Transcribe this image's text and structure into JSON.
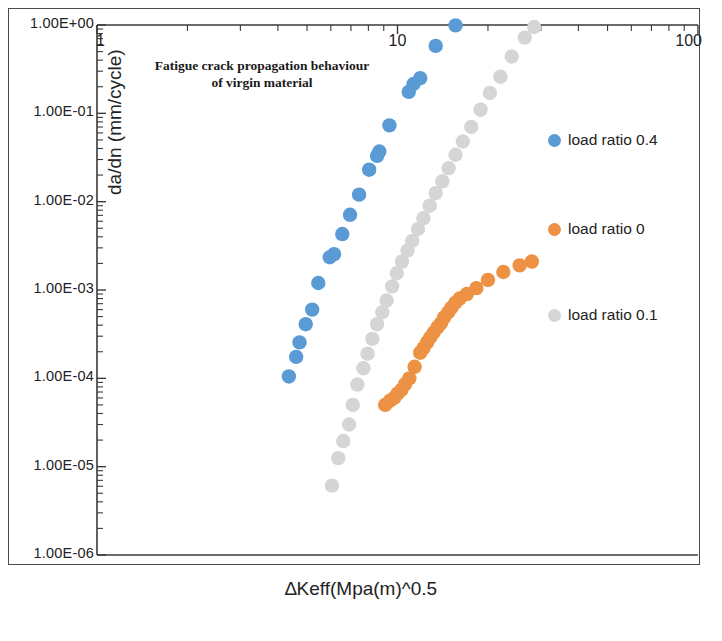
{
  "figure": {
    "title_line1": "Fatigue crack propagation behaviour",
    "title_line2": "of virgin material"
  },
  "axes": {
    "x_axis_title": "∆Keff(Mpa(m)^0.5",
    "y_axis_title": "da/dn  (mm/cycle)",
    "x_tick_labels": [
      "1",
      "10",
      "100"
    ],
    "y_tick_labels": [
      "1.00E+00",
      "1.00E-01",
      "1.00E-02",
      "1.00E-03",
      "1.00E-04",
      "1.00E-05",
      "1.00E-06"
    ]
  },
  "legend": {
    "items": [
      {
        "label": "load ratio 0.4",
        "color": "#5b9bd5"
      },
      {
        "label": "load ratio 0",
        "color": "#ed9144"
      },
      {
        "label": "load ratio 0.1",
        "color": "#d5d5d5"
      }
    ]
  },
  "chart_data": {
    "type": "scatter",
    "title": "Fatigue crack propagation behaviour of virgin material",
    "xlabel": "∆Keff(Mpa(m)^0.5",
    "ylabel": "da/dn  (mm/cycle)",
    "xscale": "log",
    "yscale": "log",
    "xlim": [
      1,
      100
    ],
    "ylim": [
      1e-06,
      1
    ],
    "x_ticks": [
      1,
      10,
      100
    ],
    "y_ticks": [
      1,
      0.1,
      0.01,
      0.001,
      0.0001,
      1e-05,
      1e-06
    ],
    "x_axis_position": "top",
    "grid": false,
    "legend_position": "right",
    "series": [
      {
        "name": "load ratio 0.4",
        "color": "#5b9bd5",
        "points": [
          [
            4.35,
            0.000105
          ],
          [
            4.6,
            0.000175
          ],
          [
            4.72,
            0.000255
          ],
          [
            4.95,
            0.00041
          ],
          [
            5.2,
            0.0006
          ],
          [
            5.45,
            0.0012
          ],
          [
            5.95,
            0.00235
          ],
          [
            6.15,
            0.00255
          ],
          [
            6.55,
            0.0043
          ],
          [
            6.95,
            0.0071
          ],
          [
            7.45,
            0.012
          ],
          [
            8.05,
            0.023
          ],
          [
            8.55,
            0.033
          ],
          [
            8.7,
            0.037
          ],
          [
            9.4,
            0.073
          ],
          [
            10.9,
            0.175
          ],
          [
            11.3,
            0.215
          ],
          [
            11.9,
            0.25
          ],
          [
            13.4,
            0.58
          ],
          [
            15.6,
            0.99
          ]
        ]
      },
      {
        "name": "load ratio 0",
        "color": "#ed9144",
        "points": [
          [
            9.1,
            5e-05
          ],
          [
            9.45,
            5.6e-05
          ],
          [
            9.75,
            6e-05
          ],
          [
            10.0,
            6.7e-05
          ],
          [
            10.3,
            7.4e-05
          ],
          [
            10.6,
            8.6e-05
          ],
          [
            10.95,
            0.0001
          ],
          [
            11.4,
            0.000135
          ],
          [
            11.9,
            0.000195
          ],
          [
            12.2,
            0.00022
          ],
          [
            12.55,
            0.000255
          ],
          [
            12.85,
            0.00029
          ],
          [
            13.2,
            0.00033
          ],
          [
            13.6,
            0.00038
          ],
          [
            13.95,
            0.00042
          ],
          [
            14.3,
            0.00049
          ],
          [
            14.75,
            0.00056
          ],
          [
            15.1,
            0.00063
          ],
          [
            15.6,
            0.00072
          ],
          [
            16.1,
            0.0008
          ],
          [
            17.0,
            0.0009
          ],
          [
            18.3,
            0.00105
          ],
          [
            20.0,
            0.0013
          ],
          [
            22.5,
            0.0016
          ],
          [
            25.5,
            0.0019
          ],
          [
            28.0,
            0.0021
          ]
        ]
      },
      {
        "name": "load ratio 0.1",
        "color": "#d5d5d5",
        "points": [
          [
            6.05,
            6.1e-06
          ],
          [
            6.35,
            1.25e-05
          ],
          [
            6.6,
            1.95e-05
          ],
          [
            6.9,
            3e-05
          ],
          [
            7.1,
            5e-05
          ],
          [
            7.35,
            8.5e-05
          ],
          [
            7.7,
            0.00013
          ],
          [
            7.95,
            0.00019
          ],
          [
            8.25,
            0.00028
          ],
          [
            8.55,
            0.00041
          ],
          [
            8.9,
            0.00056
          ],
          [
            9.2,
            0.00076
          ],
          [
            9.6,
            0.0011
          ],
          [
            9.95,
            0.00155
          ],
          [
            10.35,
            0.0021
          ],
          [
            10.8,
            0.0028
          ],
          [
            11.2,
            0.0036
          ],
          [
            11.7,
            0.0049
          ],
          [
            12.2,
            0.0065
          ],
          [
            12.8,
            0.009
          ],
          [
            13.4,
            0.0125
          ],
          [
            14.1,
            0.017
          ],
          [
            14.8,
            0.024
          ],
          [
            15.6,
            0.034
          ],
          [
            16.5,
            0.048
          ],
          [
            17.6,
            0.07
          ],
          [
            18.9,
            0.11
          ],
          [
            20.3,
            0.17
          ],
          [
            22.0,
            0.26
          ],
          [
            24.0,
            0.44
          ],
          [
            26.5,
            0.72
          ],
          [
            28.5,
            0.95
          ]
        ]
      }
    ]
  }
}
